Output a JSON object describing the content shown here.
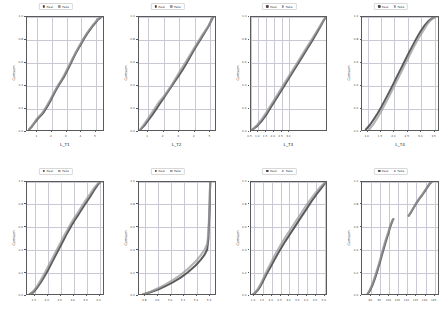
{
  "figure": {
    "rows": 2,
    "cols": 4,
    "background": "#ffffff",
    "axis_color": "#5a5a5a",
    "grid_color": "#c9c9d6"
  },
  "legend": {
    "real_label": "Real",
    "fake_label": "Fake",
    "real_color": "#4a4a4a",
    "fake_color": "#9a9a9a",
    "position": "upper center"
  },
  "chart_data": [
    {
      "type": "line",
      "title": "",
      "xlabel": "L_T1",
      "ylabel": "Cumsum",
      "xlim": [
        0.3,
        5.6
      ],
      "ylim": [
        0.0,
        1.0
      ],
      "xticks": [
        "1",
        "2",
        "3",
        "4",
        "5"
      ],
      "yticks": [
        "0.0",
        "0.2",
        "0.4",
        "0.6",
        "0.8",
        "1.0"
      ],
      "grid": true,
      "series": [
        {
          "name": "Real",
          "x": [
            0.45,
            0.6,
            0.75,
            0.9,
            1.05,
            1.2,
            1.35,
            1.5,
            1.7,
            1.9,
            2.1,
            2.3,
            2.5,
            2.7,
            2.9,
            3.1,
            3.3,
            3.5,
            3.7,
            3.9,
            4.1,
            4.3,
            4.5,
            4.7,
            4.9,
            5.1,
            5.25,
            5.4,
            5.5
          ],
          "y": [
            0.0,
            0.02,
            0.045,
            0.07,
            0.095,
            0.115,
            0.135,
            0.16,
            0.2,
            0.245,
            0.295,
            0.345,
            0.39,
            0.43,
            0.47,
            0.52,
            0.57,
            0.625,
            0.675,
            0.72,
            0.765,
            0.81,
            0.85,
            0.885,
            0.92,
            0.95,
            0.975,
            0.99,
            1.0
          ]
        },
        {
          "name": "Fake",
          "x": [
            0.45,
            0.6,
            0.75,
            0.9,
            1.05,
            1.2,
            1.35,
            1.5,
            1.7,
            1.9,
            2.1,
            2.3,
            2.5,
            2.7,
            2.9,
            3.1,
            3.3,
            3.5,
            3.7,
            3.9,
            4.1,
            4.3,
            4.5,
            4.7,
            4.9,
            5.1,
            5.25,
            5.4,
            5.5
          ],
          "y": [
            0.0,
            0.025,
            0.05,
            0.08,
            0.105,
            0.125,
            0.145,
            0.175,
            0.215,
            0.26,
            0.31,
            0.355,
            0.4,
            0.44,
            0.485,
            0.535,
            0.585,
            0.635,
            0.685,
            0.73,
            0.775,
            0.82,
            0.86,
            0.895,
            0.928,
            0.958,
            0.98,
            0.995,
            1.0
          ]
        }
      ]
    },
    {
      "type": "line",
      "title": "",
      "xlabel": "L_T2",
      "ylabel": "Cumsum",
      "xlim": [
        0.4,
        5.4
      ],
      "ylim": [
        0.0,
        1.0
      ],
      "xticks": [
        "1",
        "2",
        "3",
        "4",
        "5"
      ],
      "yticks": [
        "0.0",
        "0.2",
        "0.4",
        "0.6",
        "0.8",
        "1.0"
      ],
      "grid": true,
      "series": [
        {
          "name": "Real",
          "x": [
            0.5,
            0.75,
            1.0,
            1.25,
            1.5,
            1.75,
            2.0,
            2.25,
            2.5,
            2.75,
            3.0,
            3.25,
            3.5,
            3.75,
            4.0,
            4.25,
            4.5,
            4.75,
            5.0,
            5.2,
            5.3
          ],
          "y": [
            0.0,
            0.035,
            0.08,
            0.125,
            0.175,
            0.225,
            0.275,
            0.325,
            0.375,
            0.425,
            0.475,
            0.525,
            0.58,
            0.64,
            0.7,
            0.755,
            0.81,
            0.865,
            0.92,
            0.975,
            1.0
          ]
        },
        {
          "name": "Fake",
          "x": [
            0.5,
            0.75,
            1.0,
            1.25,
            1.5,
            1.75,
            2.0,
            2.25,
            2.5,
            2.75,
            3.0,
            3.25,
            3.5,
            3.75,
            4.0,
            4.25,
            4.5,
            4.75,
            5.0,
            5.2,
            5.3
          ],
          "y": [
            0.0,
            0.05,
            0.1,
            0.15,
            0.2,
            0.25,
            0.29,
            0.335,
            0.385,
            0.44,
            0.495,
            0.55,
            0.605,
            0.66,
            0.715,
            0.77,
            0.825,
            0.875,
            0.925,
            0.98,
            1.0
          ]
        }
      ]
    },
    {
      "type": "line",
      "title": "",
      "xlabel": "L_T3",
      "ylabel": "Cumsum",
      "xlim": [
        0.5,
        5.5
      ],
      "ylim": [
        0.0,
        1.0
      ],
      "xticks": [
        "0.5",
        "1.0",
        "1.5",
        "2.0",
        "2.5",
        "3.0"
      ],
      "yticks": [
        "0.0",
        "0.2",
        "0.4",
        "0.6",
        "0.8",
        "1.0"
      ],
      "grid": true,
      "series": [
        {
          "name": "Real",
          "x": [
            0.6,
            0.9,
            1.2,
            1.5,
            1.8,
            2.1,
            2.4,
            2.7,
            3.0,
            3.3,
            3.6,
            3.9,
            4.2,
            4.5,
            4.8,
            5.1,
            5.3,
            5.45
          ],
          "y": [
            0.0,
            0.03,
            0.075,
            0.13,
            0.195,
            0.26,
            0.325,
            0.39,
            0.455,
            0.52,
            0.585,
            0.65,
            0.715,
            0.78,
            0.85,
            0.92,
            0.97,
            1.0
          ]
        },
        {
          "name": "Fake",
          "x": [
            0.6,
            0.9,
            1.2,
            1.5,
            1.8,
            2.1,
            2.4,
            2.7,
            3.0,
            3.3,
            3.6,
            3.9,
            4.2,
            4.5,
            4.8,
            5.1,
            5.3,
            5.45
          ],
          "y": [
            0.0,
            0.04,
            0.09,
            0.15,
            0.215,
            0.28,
            0.345,
            0.41,
            0.475,
            0.54,
            0.605,
            0.67,
            0.735,
            0.8,
            0.865,
            0.93,
            0.975,
            1.0
          ]
        }
      ]
    },
    {
      "type": "line",
      "title": "",
      "xlabel": "L_T4",
      "ylabel": "Cumsum",
      "xlim": [
        0.8,
        3.7
      ],
      "ylim": [
        0.0,
        1.0
      ],
      "xticks": [
        "1.0",
        "1.5",
        "2.0",
        "2.5",
        "3.0",
        "3.5"
      ],
      "yticks": [
        "0.0",
        "0.2",
        "0.4",
        "0.6",
        "0.8",
        "1.0"
      ],
      "grid": true,
      "series": [
        {
          "name": "Real",
          "x": [
            0.95,
            1.1,
            1.25,
            1.4,
            1.55,
            1.7,
            1.85,
            2.0,
            2.15,
            2.3,
            2.45,
            2.6,
            2.75,
            2.9,
            3.05,
            3.2,
            3.35,
            3.5,
            3.6
          ],
          "y": [
            0.0,
            0.04,
            0.09,
            0.145,
            0.205,
            0.27,
            0.335,
            0.405,
            0.475,
            0.545,
            0.615,
            0.685,
            0.75,
            0.815,
            0.875,
            0.925,
            0.965,
            0.99,
            1.0
          ]
        },
        {
          "name": "Fake",
          "x": [
            1.08,
            1.23,
            1.38,
            1.53,
            1.68,
            1.83,
            1.98,
            2.13,
            2.28,
            2.43,
            2.58,
            2.73,
            2.88,
            3.03,
            3.18,
            3.3,
            3.42,
            3.52,
            3.6
          ],
          "y": [
            0.0,
            0.045,
            0.1,
            0.16,
            0.225,
            0.29,
            0.36,
            0.43,
            0.5,
            0.57,
            0.64,
            0.71,
            0.775,
            0.835,
            0.89,
            0.935,
            0.97,
            0.99,
            1.0
          ]
        }
      ]
    },
    {
      "type": "line",
      "title": "",
      "xlabel": "",
      "ylabel": "Cumsum",
      "xlim": [
        1.2,
        4.2
      ],
      "ylim": [
        0.0,
        1.0
      ],
      "xticks": [
        "1.5",
        "2.0",
        "2.5",
        "3.0",
        "3.5",
        "4.0"
      ],
      "yticks": [
        "0.0",
        "0.2",
        "0.4",
        "0.6",
        "0.8",
        "1.0"
      ],
      "grid": true,
      "series": [
        {
          "name": "Real",
          "x": [
            1.3,
            1.45,
            1.6,
            1.75,
            1.9,
            2.05,
            2.2,
            2.35,
            2.5,
            2.65,
            2.8,
            2.95,
            3.1,
            3.25,
            3.4,
            3.55,
            3.7,
            3.85,
            4.0,
            4.1
          ],
          "y": [
            0.0,
            0.02,
            0.06,
            0.11,
            0.165,
            0.225,
            0.29,
            0.355,
            0.42,
            0.485,
            0.55,
            0.61,
            0.665,
            0.715,
            0.77,
            0.82,
            0.87,
            0.925,
            0.975,
            1.0
          ]
        },
        {
          "name": "Fake",
          "x": [
            1.3,
            1.45,
            1.6,
            1.75,
            1.9,
            2.05,
            2.2,
            2.35,
            2.5,
            2.65,
            2.8,
            2.95,
            3.1,
            3.25,
            3.4,
            3.55,
            3.7,
            3.85,
            4.0,
            4.1
          ],
          "y": [
            0.0,
            0.03,
            0.075,
            0.13,
            0.19,
            0.255,
            0.32,
            0.385,
            0.45,
            0.515,
            0.575,
            0.635,
            0.69,
            0.74,
            0.795,
            0.845,
            0.895,
            0.945,
            0.985,
            1.0
          ]
        }
      ]
    },
    {
      "type": "line",
      "title": "",
      "xlabel": "",
      "ylabel": "Cumsum",
      "xlim": [
        4.75,
        5.35
      ],
      "ylim": [
        0.0,
        1.0
      ],
      "xticks": [
        "4.8",
        "4.9",
        "5.0",
        "5.1",
        "5.2",
        "5.3",
        "5.4",
        "5.5"
      ],
      "yticks": [
        "0.0",
        "0.2",
        "0.4",
        "0.6",
        "0.8",
        "1.0"
      ],
      "grid": true,
      "series": [
        {
          "name": "Real",
          "x": [
            4.78,
            4.84,
            4.9,
            4.96,
            5.02,
            5.08,
            5.14,
            5.2,
            5.24,
            5.27,
            5.29,
            5.3,
            5.305,
            5.31,
            5.312,
            5.315
          ],
          "y": [
            0.0,
            0.02,
            0.045,
            0.075,
            0.11,
            0.15,
            0.2,
            0.26,
            0.31,
            0.355,
            0.4,
            0.5,
            0.65,
            0.8,
            0.92,
            1.0
          ]
        },
        {
          "name": "Fake",
          "x": [
            4.78,
            4.84,
            4.9,
            4.96,
            5.02,
            5.08,
            5.14,
            5.2,
            5.24,
            5.27,
            5.29,
            5.3,
            5.305,
            5.31,
            5.312,
            5.315
          ],
          "y": [
            0.0,
            0.025,
            0.055,
            0.09,
            0.13,
            0.175,
            0.23,
            0.295,
            0.35,
            0.4,
            0.45,
            0.56,
            0.7,
            0.85,
            0.95,
            1.0
          ]
        }
      ]
    },
    {
      "type": "line",
      "title": "",
      "xlabel": "",
      "ylabel": "Cumsum",
      "xlim": [
        0.8,
        5.2
      ],
      "ylim": [
        0.0,
        1.0
      ],
      "xticks": [
        "1.0",
        "1.5",
        "2.0",
        "2.5",
        "3.0",
        "3.5",
        "4.0",
        "4.5",
        "5.0"
      ],
      "yticks": [
        "0.0",
        "0.2",
        "0.4",
        "0.6",
        "0.8",
        "1.0"
      ],
      "grid": true,
      "series": [
        {
          "name": "Real",
          "x": [
            0.9,
            1.05,
            1.2,
            1.35,
            1.5,
            1.7,
            1.95,
            2.2,
            2.5,
            2.8,
            3.1,
            3.4,
            3.7,
            4.0,
            4.3,
            4.6,
            4.85,
            5.05,
            5.15
          ],
          "y": [
            0.0,
            0.015,
            0.04,
            0.075,
            0.12,
            0.18,
            0.25,
            0.32,
            0.4,
            0.475,
            0.545,
            0.615,
            0.685,
            0.755,
            0.825,
            0.89,
            0.94,
            0.98,
            1.0
          ]
        },
        {
          "name": "Fake",
          "x": [
            0.9,
            1.05,
            1.2,
            1.35,
            1.5,
            1.7,
            1.95,
            2.2,
            2.5,
            2.8,
            3.1,
            3.4,
            3.7,
            4.0,
            4.3,
            4.6,
            4.85,
            5.05,
            5.15
          ],
          "y": [
            0.0,
            0.02,
            0.05,
            0.09,
            0.14,
            0.205,
            0.28,
            0.355,
            0.435,
            0.51,
            0.58,
            0.65,
            0.72,
            0.79,
            0.855,
            0.915,
            0.96,
            0.99,
            1.0
          ]
        }
      ]
    },
    {
      "type": "line",
      "title": "",
      "xlabel": "",
      "ylabel": "Cumsum",
      "xlim": [
        85,
        128
      ],
      "ylim": [
        0.0,
        1.0
      ],
      "xticks": [
        "90",
        "95",
        "100",
        "105",
        "110",
        "115",
        "120",
        "125"
      ],
      "yticks": [
        "0.0",
        "0.2",
        "0.4",
        "0.6",
        "0.8",
        "1.0"
      ],
      "grid": true,
      "bimodal": true,
      "series": [
        {
          "name": "Real",
          "x": [
            88,
            89.5,
            91,
            92.5,
            94,
            95.5,
            97,
            98.5,
            100,
            101,
            101.8,
            102.3,
            102.6,
            102.8
          ],
          "y": [
            0.0,
            0.035,
            0.085,
            0.15,
            0.225,
            0.305,
            0.39,
            0.47,
            0.545,
            0.6,
            0.635,
            0.655,
            0.665,
            0.67
          ]
        },
        {
          "name": "Real-upper",
          "x": [
            111.5,
            113,
            114.5,
            116,
            117.5,
            119,
            120.5,
            122,
            123.5,
            124.5
          ],
          "y": [
            0.7,
            0.735,
            0.775,
            0.815,
            0.85,
            0.88,
            0.915,
            0.95,
            0.985,
            1.0
          ]
        },
        {
          "name": "Fake",
          "x": [
            88,
            89.5,
            91,
            92.5,
            94,
            95.5,
            97,
            98.5,
            100,
            101,
            101.8,
            102.3,
            102.6,
            102.8
          ],
          "y": [
            0.0,
            0.045,
            0.1,
            0.17,
            0.245,
            0.325,
            0.41,
            0.49,
            0.56,
            0.615,
            0.645,
            0.662,
            0.668,
            0.67
          ]
        },
        {
          "name": "Fake-upper",
          "x": [
            111.5,
            113,
            114.5,
            116,
            117.5,
            119,
            120.5,
            122,
            123.5,
            124.5
          ],
          "y": [
            0.7,
            0.74,
            0.78,
            0.82,
            0.855,
            0.885,
            0.92,
            0.955,
            0.99,
            1.0
          ]
        }
      ]
    }
  ]
}
